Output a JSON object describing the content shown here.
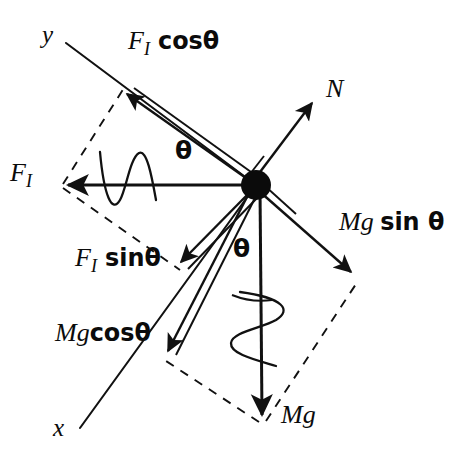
{
  "figure": {
    "type": "free-body-diagram",
    "title": "",
    "background_color": "#ffffff",
    "stroke_color": "#111111",
    "canvas": {
      "width": 456,
      "height": 466
    }
  },
  "origin": {
    "x": 256,
    "y": 185,
    "radius": 13,
    "name": "particle-mass-dot"
  },
  "axes": [
    {
      "name": "y-axis",
      "label": "y",
      "label_pos": {
        "x": 44,
        "y": 26
      },
      "from": {
        "x": 66,
        "y": 43
      },
      "to": {
        "x": 256,
        "y": 185
      }
    },
    {
      "name": "x-axis",
      "label": "x",
      "label_pos": {
        "x": 55,
        "y": 418
      },
      "from": {
        "x": 256,
        "y": 185
      },
      "to": {
        "x": 80,
        "y": 428
      }
    }
  ],
  "vectors": [
    {
      "name": "F_I",
      "label": "F_I",
      "label_base": "F",
      "label_sub": "I",
      "label_pos": {
        "x": 12,
        "y": 163
      },
      "from": {
        "x": 256,
        "y": 185
      },
      "to": {
        "x": 63,
        "y": 185
      },
      "style": "solid-single",
      "has_wave": true
    },
    {
      "name": "F_I cos theta",
      "label": "F_I cosθ",
      "label_base": "F",
      "label_sub": "I",
      "label_tail": "cosθ",
      "label_pos": {
        "x": 129,
        "y": 31
      },
      "from": {
        "x": 256,
        "y": 185
      },
      "to": {
        "x": 122,
        "y": 91
      },
      "style": "solid-double",
      "has_wave": false
    },
    {
      "name": "F_I sin theta",
      "label": "F_I sinθ",
      "label_base": "F",
      "label_sub": "I",
      "label_tail": "sinθ",
      "label_pos": {
        "x": 77,
        "y": 248
      },
      "from": {
        "x": 256,
        "y": 185
      },
      "to": {
        "x": 176,
        "y": 267
      },
      "style": "solid-double",
      "has_wave": false
    },
    {
      "name": "N",
      "label": "N",
      "label_pos": {
        "x": 327,
        "y": 80
      },
      "from": {
        "x": 256,
        "y": 185
      },
      "to": {
        "x": 316,
        "y": 98
      },
      "style": "solid-double",
      "has_wave": false
    },
    {
      "name": "Mg sin theta",
      "label": "Mg sin θ",
      "label_pos": {
        "x": 340,
        "y": 212
      },
      "from": {
        "x": 256,
        "y": 185
      },
      "to": {
        "x": 356,
        "y": 277
      },
      "style": "solid-double",
      "has_wave": false
    },
    {
      "name": "Mg cos theta",
      "label": "Mgcosθ",
      "label_pos": {
        "x": 56,
        "y": 323
      },
      "from": {
        "x": 256,
        "y": 185
      },
      "to": {
        "x": 164,
        "y": 356
      },
      "style": "solid-double",
      "has_wave": false
    },
    {
      "name": "Mg",
      "label": "Mg",
      "label_pos": {
        "x": 282,
        "y": 406
      },
      "from": {
        "x": 256,
        "y": 185
      },
      "to": {
        "x": 262,
        "y": 421
      },
      "style": "solid-single",
      "has_wave": true
    }
  ],
  "angles": [
    {
      "name": "theta-upper",
      "label": "θ",
      "label_pos": {
        "x": 176,
        "y": 141
      },
      "between": [
        "F_I",
        "F_I cos theta"
      ]
    },
    {
      "name": "theta-lower",
      "label": "θ",
      "label_pos": {
        "x": 234,
        "y": 239
      },
      "between": [
        "Mg",
        "Mg cos theta"
      ]
    }
  ],
  "dashed_construction": [
    {
      "name": "fi-parallelogram-upper",
      "from": {
        "x": 63,
        "y": 185
      },
      "to": {
        "x": 122,
        "y": 91
      }
    },
    {
      "name": "fi-parallelogram-lower",
      "from": {
        "x": 63,
        "y": 185
      },
      "to": {
        "x": 176,
        "y": 267
      }
    },
    {
      "name": "mg-parallelogram-left",
      "from": {
        "x": 262,
        "y": 421
      },
      "to": {
        "x": 164,
        "y": 356
      }
    },
    {
      "name": "mg-parallelogram-right",
      "from": {
        "x": 262,
        "y": 421
      },
      "to": {
        "x": 356,
        "y": 277
      }
    }
  ],
  "waves": [
    {
      "name": "wave-on-FI",
      "along": "F_I",
      "center": {
        "x": 128,
        "y": 185
      }
    },
    {
      "name": "wave-on-Mg",
      "along": "Mg",
      "center": {
        "x": 262,
        "y": 330
      }
    }
  ]
}
